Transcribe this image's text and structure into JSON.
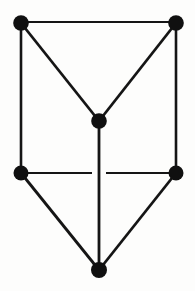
{
  "figure": {
    "kind": "undirected-graph-diagram",
    "canvas": {
      "width": 195,
      "height": 291,
      "background": "#fdfdfc"
    },
    "style": {
      "edge_color": "#151515",
      "vertex_color": "#101010",
      "edge_width": 2.4,
      "vertex_radius": 7.5,
      "crossing_gap": 13
    },
    "counts": {
      "vertices": 6,
      "edges": 9
    },
    "vertices": [
      {
        "id": "v1",
        "label": "top-left",
        "x": 21,
        "y": 23,
        "r": 7.8
      },
      {
        "id": "v2",
        "label": "top-right",
        "x": 176,
        "y": 23,
        "r": 7.8
      },
      {
        "id": "v3",
        "label": "center",
        "x": 99,
        "y": 121,
        "r": 7.8
      },
      {
        "id": "v4",
        "label": "middle-left",
        "x": 21,
        "y": 173,
        "r": 7.5
      },
      {
        "id": "v5",
        "label": "middle-right",
        "x": 176,
        "y": 173,
        "r": 7.5
      },
      {
        "id": "v6",
        "label": "bottom",
        "x": 99,
        "y": 270,
        "r": 8.0
      }
    ],
    "edges": [
      {
        "id": "e1",
        "from": "v1",
        "to": "v2",
        "label": "top-horizontal",
        "x1": 21,
        "y1": 22,
        "x2": 176,
        "y2": 22,
        "width": 2.2
      },
      {
        "id": "e2",
        "from": "v1",
        "to": "v4",
        "label": "left-vertical",
        "x1": 21,
        "y1": 23,
        "x2": 21,
        "y2": 173,
        "width": 2.6
      },
      {
        "id": "e3",
        "from": "v2",
        "to": "v5",
        "label": "right-vertical",
        "x1": 176,
        "y1": 23,
        "x2": 176,
        "y2": 173,
        "width": 2.6
      },
      {
        "id": "e4",
        "from": "v1",
        "to": "v3",
        "label": "upper-left-diagonal",
        "x1": 21,
        "y1": 23,
        "x2": 99,
        "y2": 121,
        "width": 2.8
      },
      {
        "id": "e5",
        "from": "v2",
        "to": "v3",
        "label": "upper-right-diagonal",
        "x1": 176,
        "y1": 23,
        "x2": 99,
        "y2": 121,
        "width": 2.8
      },
      {
        "id": "e6",
        "from": "v3",
        "to": "v6",
        "label": "center-vertical",
        "x1": 99,
        "y1": 121,
        "x2": 99,
        "y2": 270,
        "width": 2.8
      },
      {
        "id": "e7a",
        "from": "v4",
        "to": "v3",
        "label": "middle-horizontal-left",
        "x1": 21,
        "y1": 173,
        "x2": 92,
        "y2": 173,
        "width": 2.2
      },
      {
        "id": "e7b",
        "from": "v3",
        "to": "v5",
        "label": "middle-horizontal-right",
        "x1": 106,
        "y1": 173,
        "x2": 176,
        "y2": 173,
        "width": 2.2
      },
      {
        "id": "e8",
        "from": "v4",
        "to": "v6",
        "label": "lower-left-diagonal",
        "x1": 21,
        "y1": 173,
        "x2": 99,
        "y2": 270,
        "width": 2.8
      },
      {
        "id": "e9",
        "from": "v5",
        "to": "v6",
        "label": "lower-right-diagonal",
        "x1": 176,
        "y1": 173,
        "x2": 99,
        "y2": 270,
        "width": 2.8
      }
    ]
  }
}
